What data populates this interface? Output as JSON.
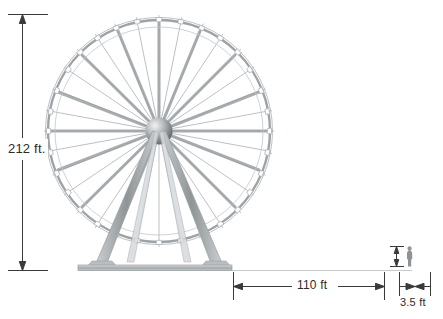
{
  "diagram": {
    "dimensions": {
      "height": {
        "label": "212 ft.",
        "orientation": "vertical",
        "value": 212,
        "unit": "ft"
      },
      "base_width": {
        "label": "110 ft",
        "orientation": "horizontal",
        "value": 110,
        "unit": "ft"
      },
      "person_height": {
        "label": "3.5 ft",
        "orientation": "horizontal",
        "value": 3.5,
        "unit": "ft"
      }
    },
    "colors": {
      "line": "#9aa0a4",
      "dimension_line": "#3a3a3a",
      "text": "#2b2b2b",
      "hub_dark": "#6e7276",
      "hub_light": "#e8eaec",
      "ground": "#b9bdc0"
    },
    "elements": {
      "wheel": "ferris-wheel",
      "hub": "wheel-hub",
      "spokes": "wheel-spokes",
      "rim": "wheel-rim",
      "cabins": "gondola-cabins",
      "legs": "support-legs",
      "base": "base-platform",
      "ground": "ground-line",
      "person": "scale-person-figure"
    }
  }
}
